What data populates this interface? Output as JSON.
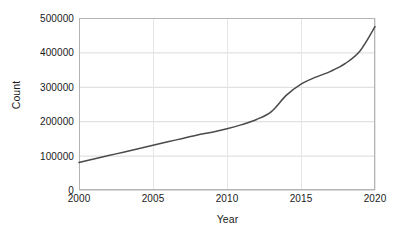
{
  "chart_data": {
    "type": "line",
    "title": "",
    "subtitle": "",
    "xlabel": "Year",
    "ylabel": "Count",
    "xlim": [
      2000,
      2020
    ],
    "ylim": [
      0,
      500000
    ],
    "xticks": [
      2000,
      2005,
      2010,
      2015,
      2020
    ],
    "xtick_labels": [
      "2000",
      "2005",
      "2010",
      "2015",
      "2020"
    ],
    "yticks": [
      0,
      100000,
      200000,
      300000,
      400000,
      500000
    ],
    "ytick_labels": [
      "0",
      "100000",
      "200000",
      "300000",
      "400000",
      "500000"
    ],
    "grid": "horizontal and vertical, light gray",
    "legend": "none",
    "annotations": [],
    "series": [
      {
        "name": "Count",
        "color": "#4a4a4a",
        "line_width": 1.5,
        "marker": "none",
        "x": [
          2000,
          2001,
          2002,
          2003,
          2004,
          2005,
          2006,
          2007,
          2008,
          2009,
          2010,
          2011,
          2012,
          2013,
          2014,
          2015,
          2016,
          2017,
          2018,
          2019,
          2020
        ],
        "values": [
          80000,
          90000,
          100000,
          110000,
          120000,
          130000,
          140000,
          150000,
          160000,
          168000,
          178000,
          190000,
          205000,
          228000,
          275000,
          308000,
          328000,
          345000,
          368000,
          405000,
          475000
        ]
      }
    ]
  },
  "colors": {
    "line": "#4a4a4a",
    "grid": "#d9d9d9",
    "frame": "#b4b4b4",
    "text": "#1a1a1a",
    "background": "#ffffff"
  }
}
